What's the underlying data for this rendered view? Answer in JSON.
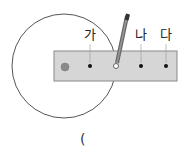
{
  "diagram": {
    "labels": [
      "가",
      "나",
      "다"
    ],
    "answer_paren": "(",
    "colors": {
      "ruler_fill": "#d6d6d6",
      "ruler_stroke": "#888888",
      "circle_stroke": "#555555",
      "pivot_fill": "#8a8a8a",
      "pencil": "#666666"
    }
  }
}
